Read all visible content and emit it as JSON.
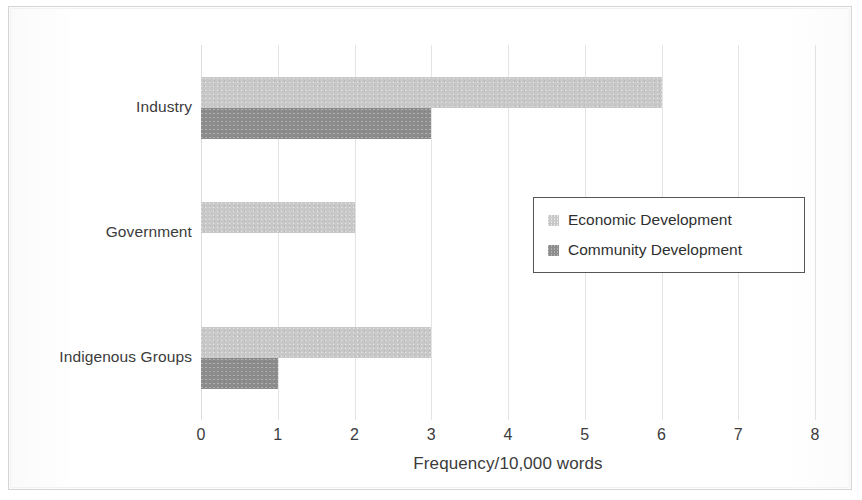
{
  "chart_data": {
    "type": "bar",
    "orientation": "horizontal",
    "title": "",
    "xlabel": "Frequency/10,000 words",
    "ylabel": "",
    "categories": [
      "Industry",
      "Government",
      "Indigenous Groups"
    ],
    "series": [
      {
        "name": "Economic Development",
        "color": "#c8c8c8",
        "values": [
          6,
          2,
          3
        ]
      },
      {
        "name": "Community Development",
        "color": "#8c8c8c",
        "values": [
          3,
          0,
          1
        ]
      }
    ],
    "xlim": [
      0,
      8
    ],
    "xticks": [
      0,
      1,
      2,
      3,
      4,
      5,
      6,
      7,
      8
    ],
    "xtick_labels": [
      "0",
      "1",
      "2",
      "3",
      "4",
      "5",
      "6",
      "7",
      "8"
    ],
    "grid": "vertical",
    "legend_position": "center-right-inside",
    "legend_border": true
  },
  "axis": {
    "x_title": "Frequency/10,000 words",
    "tick_labels": [
      "0",
      "1",
      "2",
      "3",
      "4",
      "5",
      "6",
      "7",
      "8"
    ]
  },
  "categories": [
    "Industry",
    "Government",
    "Indigenous Groups"
  ],
  "legend": {
    "entries": [
      {
        "label": "Economic Development",
        "swatch": "economic-swatch"
      },
      {
        "label": "Community Development",
        "swatch": "community-swatch"
      }
    ]
  },
  "colors": {
    "economic": "#c8c8c8",
    "community": "#8c8c8c",
    "gridline": "#e4e4e4",
    "text": "#3b3b3b",
    "frame": "#d5d5d5"
  }
}
